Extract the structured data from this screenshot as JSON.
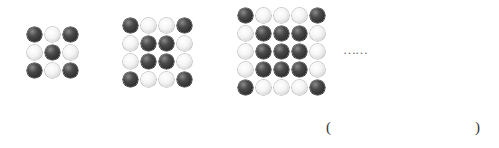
{
  "figure": {
    "patterns": [
      {
        "label": "pattern-1",
        "size": 3,
        "rows": [
          [
            "B",
            "W",
            "B"
          ],
          [
            "W",
            "B",
            "W"
          ],
          [
            "B",
            "W",
            "B"
          ]
        ]
      },
      {
        "label": "pattern-2",
        "size": 4,
        "rows": [
          [
            "B",
            "W",
            "W",
            "B"
          ],
          [
            "W",
            "B",
            "B",
            "W"
          ],
          [
            "W",
            "B",
            "B",
            "W"
          ],
          [
            "B",
            "W",
            "W",
            "B"
          ]
        ]
      },
      {
        "label": "pattern-3",
        "size": 5,
        "rows": [
          [
            "B",
            "W",
            "W",
            "W",
            "B"
          ],
          [
            "W",
            "B",
            "B",
            "B",
            "W"
          ],
          [
            "W",
            "B",
            "B",
            "B",
            "W"
          ],
          [
            "W",
            "B",
            "B",
            "B",
            "W"
          ],
          [
            "B",
            "W",
            "W",
            "W",
            "B"
          ]
        ]
      }
    ],
    "continuation": "……",
    "answer_blank": {
      "open": "(",
      "close": ")"
    },
    "colors": {
      "black_bead": "#3a3a3a",
      "white_bead": "#f0f0f0"
    }
  }
}
